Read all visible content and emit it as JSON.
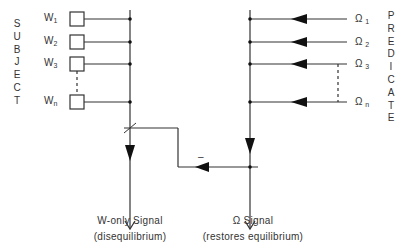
{
  "left_label": {
    "letters": [
      "S",
      "U",
      "B",
      "J",
      "E",
      "C",
      "T"
    ]
  },
  "right_label": {
    "letters": [
      "P",
      "R",
      "E",
      "D",
      "I",
      "C",
      "A",
      "T",
      "E"
    ]
  },
  "subject_inputs": [
    {
      "symbol": "W",
      "subscript": "1"
    },
    {
      "symbol": "W",
      "subscript": "2"
    },
    {
      "symbol": "W",
      "subscript": "3"
    },
    {
      "symbol": "W",
      "subscript": "n"
    }
  ],
  "predicate_inputs": [
    {
      "symbol": "Ω",
      "subscript": "1"
    },
    {
      "symbol": "Ω",
      "subscript": "2"
    },
    {
      "symbol": "Ω",
      "subscript": "3"
    },
    {
      "symbol": "Ω",
      "subscript": "n"
    }
  ],
  "feedback_sign": "–",
  "outputs": {
    "left": {
      "line1": "W-only  Signal",
      "line2": "(disequilibrium)"
    },
    "right": {
      "line1": "Ω  Signal",
      "line2": "(restores  equilibrium)"
    }
  },
  "colors": {
    "line": "#333333",
    "text": "#333333",
    "background": "#ffffff"
  }
}
